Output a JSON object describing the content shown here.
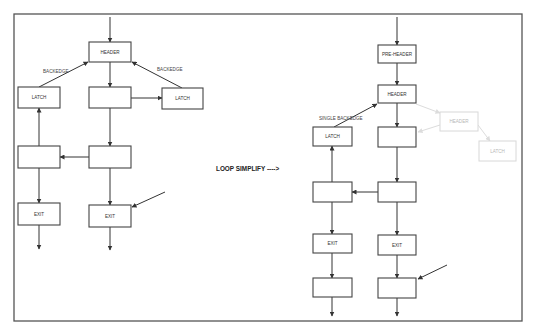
{
  "diagram": {
    "title": "LOOP SIMPLIFY ---->",
    "colors": {
      "stroke": "#333333",
      "frame": "#555555",
      "ghost": "#d8d8d8",
      "background": "#ffffff"
    },
    "frame": {
      "x": 14,
      "y": 14,
      "w": 508,
      "h": 307
    },
    "center_label": {
      "text": "LOOP SIMPLIFY ---->",
      "x": 216,
      "y": 171
    },
    "before": {
      "name": "Original loop (multiple backedges)",
      "nodes": [
        {
          "id": "l-header",
          "label": "HEADER",
          "x": 89,
          "y": 42,
          "w": 42,
          "h": 20
        },
        {
          "id": "l-latch-left",
          "label": "LATCH",
          "x": 18,
          "y": 87,
          "w": 42,
          "h": 21
        },
        {
          "id": "l-body",
          "label": "",
          "x": 89,
          "y": 87,
          "w": 42,
          "h": 21
        },
        {
          "id": "l-latch-right",
          "label": "LATCH",
          "x": 162,
          "y": 88,
          "w": 41,
          "h": 21
        },
        {
          "id": "l-block-left",
          "label": "",
          "x": 18,
          "y": 146,
          "w": 42,
          "h": 22
        },
        {
          "id": "l-block-right",
          "label": "",
          "x": 89,
          "y": 146,
          "w": 42,
          "h": 22
        },
        {
          "id": "l-exit-left",
          "label": "EXIT",
          "x": 18,
          "y": 203,
          "w": 42,
          "h": 22
        },
        {
          "id": "l-exit-right",
          "label": "EXIT",
          "x": 89,
          "y": 205,
          "w": 42,
          "h": 22
        }
      ],
      "edges": [
        {
          "d": "M110 17 L110 42",
          "arrow": true
        },
        {
          "d": "M110 62 L110 87",
          "arrow": true
        },
        {
          "d": "M131 98 L162 98",
          "arrow": true
        },
        {
          "d": "M110 108 L110 146",
          "arrow": true
        },
        {
          "d": "M89 157 L60 157",
          "arrow": true
        },
        {
          "d": "M39 146 L39 108",
          "arrow": true
        },
        {
          "d": "M39 168 L39 203",
          "arrow": true
        },
        {
          "d": "M110 168 L110 205",
          "arrow": true
        },
        {
          "d": "M39 225 L39 249",
          "arrow": true
        },
        {
          "d": "M110 227 L110 250",
          "arrow": true
        },
        {
          "d": "M165 192 L132 207",
          "arrow": true
        },
        {
          "d": "M39 87 L88 62",
          "arrow": true
        },
        {
          "d": "M182 88 L132 62",
          "arrow": true
        }
      ],
      "edge_labels": [
        {
          "text": "BACKEDGE",
          "x": 43,
          "y": 73
        },
        {
          "text": "BACKEDGE",
          "x": 157,
          "y": 71
        }
      ]
    },
    "after": {
      "name": "Simplified loop (pre-header, single backedge)",
      "nodes": [
        {
          "id": "r-preheader",
          "label": "PRE-HEADER",
          "x": 378,
          "y": 45,
          "w": 38,
          "h": 18
        },
        {
          "id": "r-header",
          "label": "HEADER",
          "x": 378,
          "y": 85,
          "w": 38,
          "h": 18
        },
        {
          "id": "r-latch",
          "label": "LATCH",
          "x": 313,
          "y": 127,
          "w": 39,
          "h": 19
        },
        {
          "id": "r-body",
          "label": "",
          "x": 378,
          "y": 127,
          "w": 38,
          "h": 20
        },
        {
          "id": "r-block-left",
          "label": "",
          "x": 313,
          "y": 182,
          "w": 39,
          "h": 20
        },
        {
          "id": "r-block-right",
          "label": "",
          "x": 378,
          "y": 182,
          "w": 38,
          "h": 20
        },
        {
          "id": "r-exit-left",
          "label": "EXIT",
          "x": 313,
          "y": 234,
          "w": 39,
          "h": 19
        },
        {
          "id": "r-exit-right",
          "label": "EXIT",
          "x": 378,
          "y": 235,
          "w": 38,
          "h": 20
        },
        {
          "id": "r-bottom-left",
          "label": "",
          "x": 313,
          "y": 278,
          "w": 39,
          "h": 19
        },
        {
          "id": "r-bottom-right",
          "label": "",
          "x": 378,
          "y": 278,
          "w": 38,
          "h": 20
        }
      ],
      "ghost_nodes": [
        {
          "id": "g-header",
          "label": "HEADER",
          "x": 440,
          "y": 112,
          "w": 38,
          "h": 19
        },
        {
          "id": "g-latch",
          "label": "LATCH",
          "x": 479,
          "y": 141,
          "w": 37,
          "h": 20
        }
      ],
      "edges": [
        {
          "d": "M397 17 L397 45",
          "arrow": true
        },
        {
          "d": "M397 63 L397 85",
          "arrow": true
        },
        {
          "d": "M397 103 L397 127",
          "arrow": true
        },
        {
          "d": "M397 147 L397 182",
          "arrow": true
        },
        {
          "d": "M378 192 L352 192",
          "arrow": true
        },
        {
          "d": "M332 182 L332 146",
          "arrow": true
        },
        {
          "d": "M332 202 L332 234",
          "arrow": true
        },
        {
          "d": "M397 202 L397 235",
          "arrow": true
        },
        {
          "d": "M332 253 L332 278",
          "arrow": true
        },
        {
          "d": "M397 255 L397 278",
          "arrow": true
        },
        {
          "d": "M332 297 L332 316",
          "arrow": true
        },
        {
          "d": "M397 298 L397 316",
          "arrow": true
        },
        {
          "d": "M447 265 L418 279",
          "arrow": true
        },
        {
          "d": "M334 127 L377 104",
          "arrow": true
        }
      ],
      "ghost_edges": [
        {
          "d": "M416 104 L440 113",
          "arrow": true
        },
        {
          "d": "M440 125 L418 132",
          "arrow": true
        },
        {
          "d": "M478 125 L490 141",
          "arrow": true
        }
      ],
      "edge_labels": [
        {
          "text": "SINGLE BACKEDGE",
          "x": 319,
          "y": 120
        }
      ]
    }
  }
}
